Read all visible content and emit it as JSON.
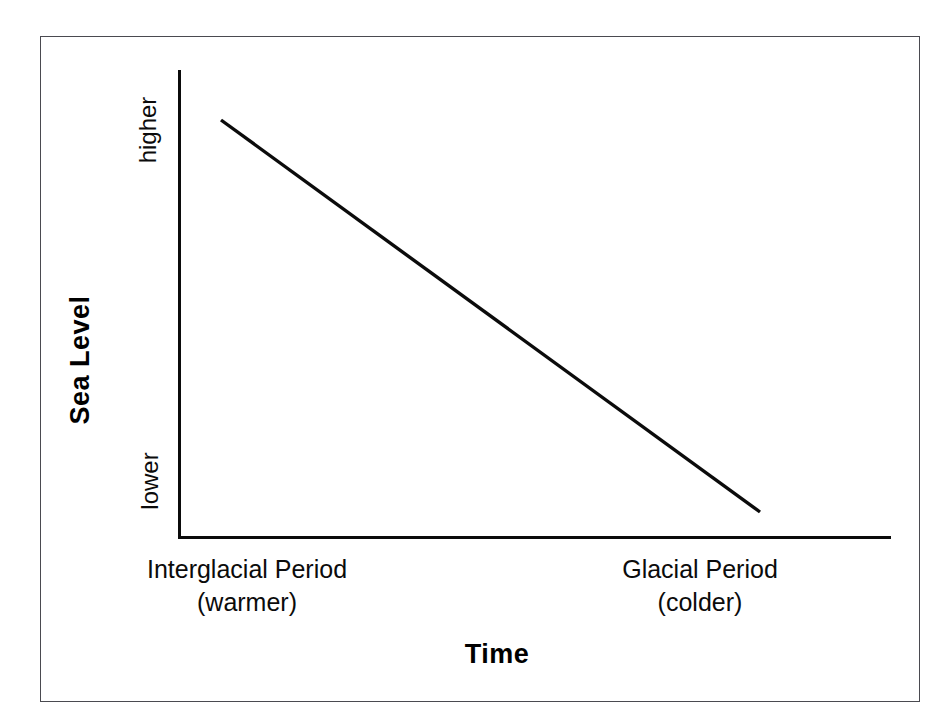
{
  "figure": {
    "background_color": "#ffffff",
    "frame_color": "#4a4a50",
    "ink_color": "#0b0b0b"
  },
  "axes": {
    "y_title": "Sea Level",
    "x_title": "Time",
    "y_tick_top": "higher",
    "y_tick_bottom": "lower",
    "x_cat_left_line1": "Interglacial Period",
    "x_cat_left_line2": "(warmer)",
    "x_cat_right_line1": "Glacial Period",
    "x_cat_right_line2": "(colder)"
  },
  "chart_data": {
    "type": "line",
    "title": "",
    "subtitle": "",
    "xlabel": "Time",
    "ylabel": "Sea Level",
    "grid": false,
    "legend": false,
    "legend_position": "none",
    "x_axis_type": "categorical-ordinal",
    "x_tick_labels": [
      "Interglacial Period (warmer)",
      "Glacial Period (colder)"
    ],
    "y_tick_labels": [
      "lower",
      "higher"
    ],
    "y_axis_direction": "increasing upward",
    "ylim": [
      "lower",
      "higher"
    ],
    "annotations": [],
    "series": [
      {
        "name": "Sea Level",
        "color": "#0b0b0b",
        "line_width_px": 3,
        "x": [
          "Interglacial Period (warmer)",
          "Glacial Period (colder)"
        ],
        "y": [
          "higher",
          "lower"
        ],
        "points_px": [
          {
            "x": 221,
            "y": 120
          },
          {
            "x": 760,
            "y": 512
          }
        ],
        "description": "Sea level decreases linearly from higher during the interglacial (warmer) period to lower during the glacial (colder) period."
      }
    ]
  }
}
